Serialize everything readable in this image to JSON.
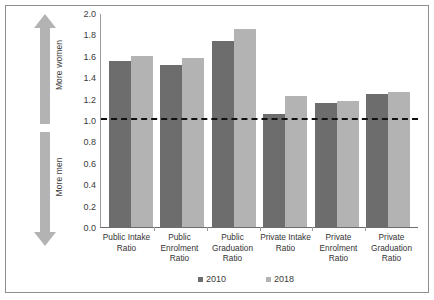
{
  "chart_data": {
    "type": "bar",
    "title": "",
    "subtitle": "",
    "xlabel": "",
    "ylabel": "",
    "ylim": [
      0.0,
      2.0
    ],
    "ytick_step": 0.2,
    "grid": false,
    "legend_position": "bottom",
    "categories": [
      "Public Intake Ratio",
      "Public Enrolment Ratio",
      "Public Graduation Ratio",
      "Private Intake Ratio",
      "Private Enrolment Ratio",
      "Private Graduation Ratio"
    ],
    "category_lines": [
      [
        "Public Intake",
        "Ratio"
      ],
      [
        "Public",
        "Enrolment",
        "Ratio"
      ],
      [
        "Public",
        "Graduation",
        "Ratio"
      ],
      [
        "Private Intake",
        "Ratio"
      ],
      [
        "Private",
        "Enrolment",
        "Ratio"
      ],
      [
        "Private",
        "Graduation",
        "Ratio"
      ]
    ],
    "series": [
      {
        "name": "2010",
        "color": "#6d6d6d",
        "values": [
          1.55,
          1.51,
          1.74,
          1.06,
          1.16,
          1.24
        ]
      },
      {
        "name": "2018",
        "color": "#b3b3b3",
        "values": [
          1.6,
          1.58,
          1.85,
          1.22,
          1.18,
          1.26
        ]
      }
    ],
    "ytick_labels": [
      "0.0",
      "0.2",
      "0.4",
      "0.6",
      "0.8",
      "1.0",
      "1.2",
      "1.4",
      "1.6",
      "1.8",
      "2.0"
    ],
    "annotations": [
      {
        "name": "parity-line",
        "type": "hline",
        "y": 1.0,
        "style": "dashed",
        "color": "#111111"
      }
    ]
  },
  "axis_annotations": {
    "up_arrow_label": "More women",
    "down_arrow_label": "More men",
    "arrow_color": "#b3b3b3"
  },
  "legend": {
    "items": [
      {
        "label": "2010",
        "color": "#6d6d6d"
      },
      {
        "label": "2018",
        "color": "#b3b3b3"
      }
    ]
  }
}
